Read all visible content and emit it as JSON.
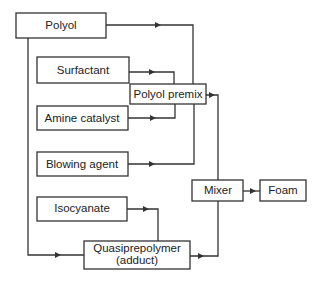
{
  "diagram": {
    "type": "process-flow",
    "nodes": {
      "polyol": {
        "label": "Polyol"
      },
      "surfactant": {
        "label": "Surfactant"
      },
      "amine_catalyst": {
        "label": "Amine catalyst"
      },
      "polyol_premix": {
        "label": "Polyol premix"
      },
      "blowing_agent": {
        "label": "Blowing agent"
      },
      "isocyanate": {
        "label": "Isocyanate"
      },
      "quasiprepolymer": {
        "label_line1": "Quasiprepolymer",
        "label_line2": "(adduct)"
      },
      "mixer": {
        "label": "Mixer"
      },
      "foam": {
        "label": "Foam"
      }
    },
    "edges": [
      {
        "from": "Polyol",
        "to": "Polyol premix"
      },
      {
        "from": "Surfactant",
        "to": "Polyol premix"
      },
      {
        "from": "Amine catalyst",
        "to": "Polyol premix"
      },
      {
        "from": "Blowing agent",
        "to": "Polyol premix"
      },
      {
        "from": "Polyol",
        "to": "Quasiprepolymer (adduct)"
      },
      {
        "from": "Isocyanate",
        "to": "Quasiprepolymer (adduct)"
      },
      {
        "from": "Polyol premix",
        "to": "Mixer"
      },
      {
        "from": "Quasiprepolymer (adduct)",
        "to": "Mixer"
      },
      {
        "from": "Mixer",
        "to": "Foam"
      }
    ]
  }
}
